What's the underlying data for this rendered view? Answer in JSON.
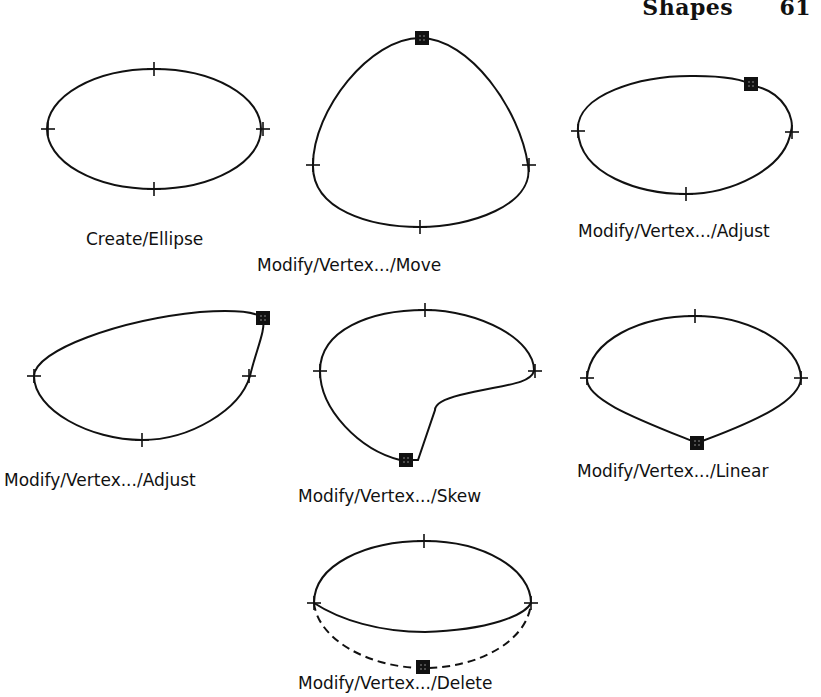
{
  "header": {
    "title": "Shapes",
    "page_number": "61"
  },
  "figures": [
    {
      "id": "create-ellipse",
      "caption": "Create/Ellipse"
    },
    {
      "id": "vertex-move",
      "caption": "Modify/Vertex.../Move"
    },
    {
      "id": "vertex-adjust-1",
      "caption": "Modify/Vertex.../Adjust"
    },
    {
      "id": "vertex-adjust-2",
      "caption": "Modify/Vertex.../Adjust"
    },
    {
      "id": "vertex-skew",
      "caption": "Modify/Vertex.../Skew"
    },
    {
      "id": "vertex-linear",
      "caption": "Modify/Vertex.../Linear"
    },
    {
      "id": "vertex-delete",
      "caption": "Modify/Vertex.../Delete"
    }
  ],
  "colors": {
    "ink": "#111111",
    "paper": "#ffffff"
  }
}
